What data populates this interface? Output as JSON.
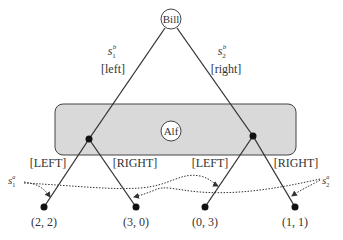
{
  "players": {
    "root": "Bill",
    "info_set": "Alf"
  },
  "bill_moves": [
    {
      "strategy_base": "s",
      "strategy_sub": "1",
      "strategy_sup": "b",
      "action": "[left]"
    },
    {
      "strategy_base": "s",
      "strategy_sub": "2",
      "strategy_sup": "b",
      "action": "[right]"
    }
  ],
  "alf_moves": [
    {
      "label": "[LEFT]"
    },
    {
      "label": "[RIGHT]"
    },
    {
      "label": "[LEFT]"
    },
    {
      "label": "[RIGHT]"
    }
  ],
  "alf_strategies": [
    {
      "base": "s",
      "sub": "1",
      "sup": "a"
    },
    {
      "base": "s",
      "sub": "2",
      "sup": "a"
    }
  ],
  "payoffs": [
    "(2, 2)",
    "(3, 0)",
    "(0, 3)",
    "(1, 1)"
  ],
  "colors": {
    "line": "#333333",
    "info_set_fill": "#d9d9d9",
    "info_set_stroke": "#444444",
    "node": "#111111"
  }
}
